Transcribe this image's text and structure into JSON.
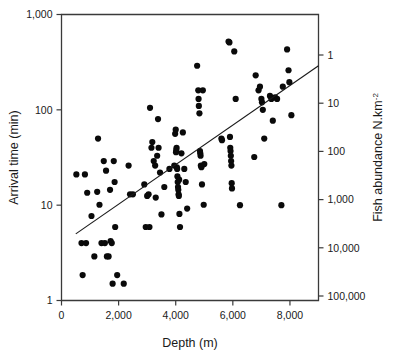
{
  "chart_data": {
    "type": "scatter",
    "title": "",
    "xlabel": "Depth (m)",
    "ylabel": "Arrival time (min)",
    "y2label": "Fish abundance N.km-2",
    "y2label_base": "Fish abundance N.km",
    "y2label_exponent": "-2",
    "grid": false,
    "legend": "none",
    "xlim": [
      0,
      9000
    ],
    "xticks": [
      0,
      2000,
      4000,
      6000,
      8000
    ],
    "xticklabels": [
      "0",
      "2,000",
      "4,000",
      "6,000",
      "8,000"
    ],
    "yscale": "log",
    "ylim": [
      1,
      1000
    ],
    "yticks": [
      1,
      10,
      100,
      1000
    ],
    "yticklabels": [
      "1",
      "10",
      "100",
      "1,000"
    ],
    "y2scale": "log-inverted",
    "y2ticks": [
      1,
      10,
      100,
      1000,
      10000,
      100000
    ],
    "y2ticklabels": [
      "1",
      "10",
      "100",
      "1,000",
      "10,000",
      "100,000"
    ],
    "point_color": "#0a0a0a",
    "line_color": "#1a1a1a",
    "axis_color": "#3a3a3a",
    "fit_line": {
      "label": "",
      "x_start": 500,
      "y_start": 5.0,
      "x_end": 9000,
      "y_end": 290
    },
    "points": [
      {
        "x": 520,
        "y": 21
      },
      {
        "x": 700,
        "y": 4.0
      },
      {
        "x": 740,
        "y": 1.85
      },
      {
        "x": 820,
        "y": 21
      },
      {
        "x": 860,
        "y": 4.0
      },
      {
        "x": 900,
        "y": 13.5
      },
      {
        "x": 1050,
        "y": 7.7
      },
      {
        "x": 1150,
        "y": 2.9
      },
      {
        "x": 1280,
        "y": 50
      },
      {
        "x": 1330,
        "y": 10.1
      },
      {
        "x": 1400,
        "y": 4.0
      },
      {
        "x": 1480,
        "y": 29
      },
      {
        "x": 1520,
        "y": 4.0
      },
      {
        "x": 1560,
        "y": 23
      },
      {
        "x": 1590,
        "y": 2.9
      },
      {
        "x": 1650,
        "y": 2.9
      },
      {
        "x": 1700,
        "y": 14.5
      },
      {
        "x": 1720,
        "y": 4.2
      },
      {
        "x": 1760,
        "y": 4.0
      },
      {
        "x": 1790,
        "y": 1.5
      },
      {
        "x": 1830,
        "y": 29
      },
      {
        "x": 1860,
        "y": 17.5
      },
      {
        "x": 1880,
        "y": 5.9
      },
      {
        "x": 1950,
        "y": 1.85
      },
      {
        "x": 2180,
        "y": 1.5
      },
      {
        "x": 2350,
        "y": 26
      },
      {
        "x": 2400,
        "y": 13.0
      },
      {
        "x": 2900,
        "y": 16.5
      },
      {
        "x": 2950,
        "y": 5.9
      },
      {
        "x": 3050,
        "y": 13.0
      },
      {
        "x": 3080,
        "y": 5.9
      },
      {
        "x": 3100,
        "y": 105
      },
      {
        "x": 3150,
        "y": 40
      },
      {
        "x": 3180,
        "y": 46
      },
      {
        "x": 3230,
        "y": 29
      },
      {
        "x": 3280,
        "y": 26
      },
      {
        "x": 3300,
        "y": 12.0
      },
      {
        "x": 3350,
        "y": 33
      },
      {
        "x": 3380,
        "y": 80
      },
      {
        "x": 3400,
        "y": 40
      },
      {
        "x": 3450,
        "y": 22
      },
      {
        "x": 3500,
        "y": 8.0
      },
      {
        "x": 3600,
        "y": 15.5
      },
      {
        "x": 3780,
        "y": 24
      },
      {
        "x": 3950,
        "y": 26
      },
      {
        "x": 3980,
        "y": 56
      },
      {
        "x": 4000,
        "y": 62
      },
      {
        "x": 4010,
        "y": 36
      },
      {
        "x": 4020,
        "y": 38
      },
      {
        "x": 4030,
        "y": 40
      },
      {
        "x": 4040,
        "y": 25
      },
      {
        "x": 4050,
        "y": 24
      },
      {
        "x": 4060,
        "y": 20
      },
      {
        "x": 4070,
        "y": 17.5
      },
      {
        "x": 4080,
        "y": 15.5
      },
      {
        "x": 4090,
        "y": 14.5
      },
      {
        "x": 4100,
        "y": 13.0
      },
      {
        "x": 4110,
        "y": 12.5
      },
      {
        "x": 4120,
        "y": 18.5
      },
      {
        "x": 4130,
        "y": 8.1
      },
      {
        "x": 4150,
        "y": 5.9
      },
      {
        "x": 4200,
        "y": 35
      },
      {
        "x": 4250,
        "y": 58
      },
      {
        "x": 4300,
        "y": 24
      },
      {
        "x": 4350,
        "y": 17.5
      },
      {
        "x": 4400,
        "y": 9.2
      },
      {
        "x": 4750,
        "y": 290
      },
      {
        "x": 4790,
        "y": 160
      },
      {
        "x": 4800,
        "y": 130
      },
      {
        "x": 4810,
        "y": 110
      },
      {
        "x": 4830,
        "y": 92
      },
      {
        "x": 4850,
        "y": 37
      },
      {
        "x": 4860,
        "y": 35
      },
      {
        "x": 4870,
        "y": 33
      },
      {
        "x": 4880,
        "y": 26
      },
      {
        "x": 4900,
        "y": 25
      },
      {
        "x": 4920,
        "y": 16.5
      },
      {
        "x": 4950,
        "y": 160
      },
      {
        "x": 4980,
        "y": 10.1
      },
      {
        "x": 5600,
        "y": 50
      },
      {
        "x": 5620,
        "y": 48
      },
      {
        "x": 5850,
        "y": 520
      },
      {
        "x": 5880,
        "y": 510
      },
      {
        "x": 5900,
        "y": 52
      },
      {
        "x": 5910,
        "y": 40
      },
      {
        "x": 5920,
        "y": 37
      },
      {
        "x": 5930,
        "y": 33
      },
      {
        "x": 5940,
        "y": 29
      },
      {
        "x": 5950,
        "y": 26
      },
      {
        "x": 5960,
        "y": 17.0
      },
      {
        "x": 5970,
        "y": 15.0
      },
      {
        "x": 6050,
        "y": 410
      },
      {
        "x": 6100,
        "y": 130
      },
      {
        "x": 6250,
        "y": 10.0
      },
      {
        "x": 6750,
        "y": 32
      },
      {
        "x": 6800,
        "y": 230
      },
      {
        "x": 6900,
        "y": 160
      },
      {
        "x": 6950,
        "y": 175
      },
      {
        "x": 7000,
        "y": 130
      },
      {
        "x": 7020,
        "y": 120
      },
      {
        "x": 7050,
        "y": 100
      },
      {
        "x": 7100,
        "y": 50
      },
      {
        "x": 7300,
        "y": 140
      },
      {
        "x": 7350,
        "y": 130
      },
      {
        "x": 7400,
        "y": 77
      },
      {
        "x": 7480,
        "y": 135
      },
      {
        "x": 7550,
        "y": 130
      },
      {
        "x": 7700,
        "y": 10.0
      },
      {
        "x": 7750,
        "y": 175
      },
      {
        "x": 7900,
        "y": 430
      },
      {
        "x": 7950,
        "y": 260
      },
      {
        "x": 7980,
        "y": 195
      },
      {
        "x": 8050,
        "y": 88
      },
      {
        "x": 2500,
        "y": 13.0
      },
      {
        "x": 3000,
        "y": 12.5
      },
      {
        "x": 1250,
        "y": 13.8
      },
      {
        "x": 5000,
        "y": 27
      }
    ]
  }
}
